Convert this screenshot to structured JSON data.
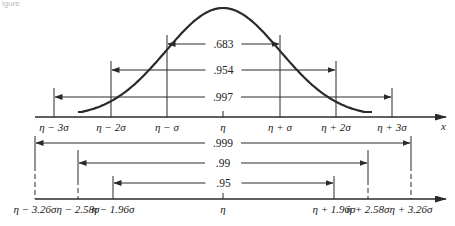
{
  "figure": {
    "top_fragment": "igure",
    "x_axis_label": "x",
    "curve": {
      "peak_x": 223,
      "peak_y": 8,
      "left_end_x": 78,
      "right_end_x": 372,
      "tail_y": 112
    },
    "upper_axis": {
      "y": 117,
      "x_start": 35,
      "x_end": 446,
      "ticks": [
        {
          "label": "η − 3σ",
          "x": 54,
          "top": 88
        },
        {
          "label": "η − 2σ",
          "x": 111,
          "top": 61
        },
        {
          "label": "η − σ",
          "x": 167,
          "top": 35
        },
        {
          "label": "η",
          "x": 223,
          "top": 112
        },
        {
          "label": "η + σ",
          "x": 280,
          "top": 35
        },
        {
          "label": "η + 2σ",
          "x": 336,
          "top": 61
        },
        {
          "label": "η + 3σ",
          "x": 392,
          "top": 88
        }
      ],
      "intervals": [
        {
          "label": ".683",
          "y": 44,
          "from": 167,
          "to": 280
        },
        {
          "label": ".954",
          "y": 70,
          "from": 111,
          "to": 336
        },
        {
          "label": ".997",
          "y": 97,
          "from": 54,
          "to": 392
        }
      ]
    },
    "lower_axis": {
      "y": 199,
      "x_start": 35,
      "x_end": 446,
      "ticks": [
        {
          "label": "η − 3.26σ",
          "x": 35,
          "top": 136
        },
        {
          "label": "η − 2.58σ",
          "x": 78,
          "top": 150
        },
        {
          "label": "η − 1.96σ",
          "x": 113,
          "top": 176
        },
        {
          "label": "η",
          "x": 223,
          "top": 194
        },
        {
          "label": "η + 1.96σ",
          "x": 334,
          "top": 176
        },
        {
          "label": "η + 2.58σ",
          "x": 368,
          "top": 150
        },
        {
          "label": "η + 3.26σ",
          "x": 411,
          "top": 136
        }
      ],
      "intervals": [
        {
          "label": ".999",
          "y": 143,
          "from": 35,
          "to": 411
        },
        {
          "label": ".99",
          "y": 163,
          "from": 78,
          "to": 368
        },
        {
          "label": ".95",
          "y": 183,
          "from": 113,
          "to": 334
        }
      ]
    }
  }
}
